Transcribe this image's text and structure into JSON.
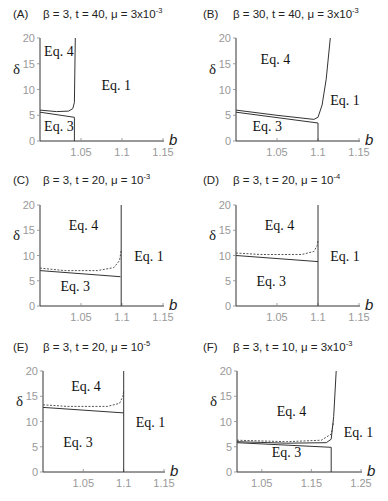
{
  "figure": {
    "panels": [
      {
        "id": "A",
        "label": "(A)",
        "params": "β = 3, t = 40, μ = 3x10",
        "exp": "-3"
      },
      {
        "id": "B",
        "label": "(B)",
        "params": "β = 30, t = 40, μ = 3x10",
        "exp": "-3"
      },
      {
        "id": "C",
        "label": "(C)",
        "params": "β = 3, t = 20, μ = 10",
        "exp": "-3"
      },
      {
        "id": "D",
        "label": "(D)",
        "params": "β = 3, t = 20, μ = 10",
        "exp": "-4"
      },
      {
        "id": "E",
        "label": "(E)",
        "params": "β = 3, t = 20, μ = 10",
        "exp": "-5"
      },
      {
        "id": "F",
        "label": "(F)",
        "params": "β = 3, t = 10, μ = 3x10",
        "exp": "-3"
      }
    ]
  },
  "chart_data": [
    {
      "panel": "A",
      "type": "line",
      "title": "β = 3, t = 40, μ = 3x10^-3",
      "xlabel": "b",
      "ylabel": "δ",
      "xlim": [
        1.0,
        1.15
      ],
      "ylim": [
        0,
        20
      ],
      "xticks": [
        1.05,
        1.1,
        1.15
      ],
      "yticks": [
        0,
        5,
        10,
        15,
        20
      ],
      "regions": [
        {
          "label": "Eq. 4",
          "x": 1.005,
          "y": 16.5
        },
        {
          "label": "Eq. 1",
          "x": 1.075,
          "y": 10
        },
        {
          "label": "Eq. 3",
          "x": 1.005,
          "y": 2
        }
      ],
      "series": [
        {
          "name": "boundary-solid-lower",
          "style": "solid",
          "x": [
            1.0,
            1.042
          ],
          "y": [
            5.6,
            4.6
          ]
        },
        {
          "name": "boundary-solid-upper",
          "style": "solid",
          "x": [
            1.0,
            1.02,
            1.035,
            1.04,
            1.042,
            1.043
          ],
          "y": [
            6.0,
            5.7,
            5.8,
            6.3,
            7.5,
            20
          ]
        },
        {
          "name": "vertical-boundary",
          "style": "solid",
          "x": [
            1.042,
            1.042
          ],
          "y": [
            0,
            4.6
          ]
        }
      ]
    },
    {
      "panel": "B",
      "type": "line",
      "title": "β = 30, t = 40, μ = 3x10^-3",
      "xlabel": "b",
      "ylabel": "δ",
      "xlim": [
        1.0,
        1.15
      ],
      "ylim": [
        0,
        20
      ],
      "xticks": [
        1.05,
        1.1,
        1.15
      ],
      "yticks": [
        0,
        5,
        10,
        15,
        20
      ],
      "regions": [
        {
          "label": "Eq. 4",
          "x": 1.03,
          "y": 15
        },
        {
          "label": "Eq. 1",
          "x": 1.115,
          "y": 7
        },
        {
          "label": "Eq. 3",
          "x": 1.02,
          "y": 2
        }
      ],
      "series": [
        {
          "name": "boundary-solid-lower",
          "style": "solid",
          "x": [
            1.0,
            1.1
          ],
          "y": [
            5.6,
            3.5
          ]
        },
        {
          "name": "boundary-solid-upper",
          "style": "solid",
          "x": [
            1.0,
            1.05,
            1.095,
            1.1,
            1.105,
            1.11,
            1.115
          ],
          "y": [
            6.0,
            5.0,
            4.2,
            4.6,
            7,
            12,
            20
          ]
        },
        {
          "name": "vertical-boundary",
          "style": "solid",
          "x": [
            1.1,
            1.1
          ],
          "y": [
            0,
            3.5
          ]
        }
      ]
    },
    {
      "panel": "C",
      "type": "line",
      "title": "β = 3, t = 20, μ = 10^-3",
      "xlabel": "b",
      "ylabel": "δ",
      "xlim": [
        1.0,
        1.15
      ],
      "ylim": [
        0,
        20
      ],
      "xticks": [
        1.05,
        1.1,
        1.15
      ],
      "yticks": [
        0,
        5,
        10,
        15,
        20
      ],
      "regions": [
        {
          "label": "Eq. 4",
          "x": 1.035,
          "y": 15
        },
        {
          "label": "Eq. 1",
          "x": 1.115,
          "y": 9
        },
        {
          "label": "Eq. 3",
          "x": 1.025,
          "y": 3
        }
      ],
      "series": [
        {
          "name": "boundary-solid",
          "style": "solid",
          "x": [
            1.0,
            1.098
          ],
          "y": [
            7.0,
            5.8
          ]
        },
        {
          "name": "boundary-dashed",
          "style": "dashed",
          "x": [
            1.0,
            1.03,
            1.07,
            1.09,
            1.097,
            1.099
          ],
          "y": [
            7.5,
            7.0,
            7.0,
            7.6,
            9,
            11
          ]
        },
        {
          "name": "vertical-boundary",
          "style": "solid",
          "x": [
            1.099,
            1.099
          ],
          "y": [
            0,
            20
          ]
        }
      ]
    },
    {
      "panel": "D",
      "type": "line",
      "title": "β = 3, t = 20, μ = 10^-4",
      "xlabel": "b",
      "ylabel": "δ",
      "xlim": [
        1.0,
        1.15
      ],
      "ylim": [
        0,
        20
      ],
      "xticks": [
        1.05,
        1.1,
        1.15
      ],
      "yticks": [
        0,
        5,
        10,
        15,
        20
      ],
      "regions": [
        {
          "label": "Eq. 4",
          "x": 1.035,
          "y": 15
        },
        {
          "label": "Eq. 1",
          "x": 1.115,
          "y": 9
        },
        {
          "label": "Eq. 3",
          "x": 1.025,
          "y": 4
        }
      ],
      "series": [
        {
          "name": "boundary-solid",
          "style": "solid",
          "x": [
            1.0,
            1.1
          ],
          "y": [
            10.0,
            8.8
          ]
        },
        {
          "name": "boundary-dashed",
          "style": "dashed",
          "x": [
            1.0,
            1.03,
            1.08,
            1.095,
            1.099,
            1.1
          ],
          "y": [
            10.5,
            10.2,
            10.2,
            10.8,
            12,
            13
          ]
        },
        {
          "name": "vertical-boundary",
          "style": "solid",
          "x": [
            1.1,
            1.1
          ],
          "y": [
            0,
            20
          ]
        }
      ]
    },
    {
      "panel": "E",
      "type": "line",
      "title": "β = 3, t = 20, μ = 10^-5",
      "xlabel": "b",
      "ylabel": "δ",
      "xlim": [
        1.0,
        1.15
      ],
      "ylim": [
        0,
        20
      ],
      "xticks": [
        1.05,
        1.1,
        1.15
      ],
      "yticks": [
        0,
        5,
        10,
        15,
        20
      ],
      "regions": [
        {
          "label": "Eq. 4",
          "x": 1.035,
          "y": 16
        },
        {
          "label": "Eq. 1",
          "x": 1.115,
          "y": 9
        },
        {
          "label": "Eq. 3",
          "x": 1.025,
          "y": 5
        }
      ],
      "series": [
        {
          "name": "boundary-solid",
          "style": "solid",
          "x": [
            1.0,
            1.1
          ],
          "y": [
            12.8,
            11.7
          ]
        },
        {
          "name": "boundary-dashed",
          "style": "dashed",
          "x": [
            1.0,
            1.03,
            1.08,
            1.095,
            1.099,
            1.1
          ],
          "y": [
            13.3,
            13.0,
            13.0,
            13.6,
            15,
            16
          ]
        },
        {
          "name": "vertical-boundary",
          "style": "solid",
          "x": [
            1.1,
            1.1
          ],
          "y": [
            0,
            20
          ]
        }
      ]
    },
    {
      "panel": "F",
      "type": "line",
      "title": "β = 3, t = 10, μ = 3x10^-3",
      "xlabel": "b",
      "ylabel": "δ",
      "xlim": [
        1.0,
        1.25
      ],
      "ylim": [
        0,
        20
      ],
      "xticks": [
        1.05,
        1.15,
        1.25
      ],
      "yticks": [
        0,
        5,
        10,
        15,
        20
      ],
      "regions": [
        {
          "label": "Eq. 4",
          "x": 1.08,
          "y": 11
        },
        {
          "label": "Eq. 1",
          "x": 1.215,
          "y": 7
        },
        {
          "label": "Eq. 3",
          "x": 1.07,
          "y": 3
        }
      ],
      "series": [
        {
          "name": "boundary-solid-lower",
          "style": "solid",
          "x": [
            1.0,
            1.19
          ],
          "y": [
            5.8,
            4.9
          ]
        },
        {
          "name": "boundary-dashed",
          "style": "dashed",
          "x": [
            1.0,
            1.1,
            1.17,
            1.19,
            1.195
          ],
          "y": [
            6.3,
            6.0,
            6.3,
            7.5,
            10
          ]
        },
        {
          "name": "boundary-solid-upper",
          "style": "solid",
          "x": [
            1.0,
            1.1,
            1.18,
            1.19,
            1.195,
            1.2
          ],
          "y": [
            6.0,
            5.7,
            5.8,
            6.5,
            11,
            20
          ]
        },
        {
          "name": "vertical-boundary",
          "style": "solid",
          "x": [
            1.19,
            1.19
          ],
          "y": [
            0,
            4.9
          ]
        }
      ]
    }
  ]
}
